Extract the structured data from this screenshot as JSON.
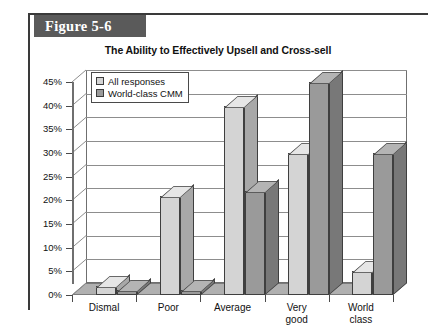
{
  "figure": {
    "tab_label": "Figure 5-6"
  },
  "chart_data": {
    "type": "bar",
    "title": "The Ability to Effectively Upsell and Cross-sell",
    "xlabel": "",
    "ylabel": "",
    "ylim": [
      0,
      45
    ],
    "ytick_labels": [
      "0%",
      "5%",
      "10%",
      "15%",
      "20%",
      "25%",
      "30%",
      "35%",
      "40%",
      "45%"
    ],
    "ytick_values": [
      0,
      5,
      10,
      15,
      20,
      25,
      30,
      35,
      40,
      45
    ],
    "grid": true,
    "legend_position": "top-left",
    "three_d": true,
    "categories": [
      "Dismal",
      "Poor",
      "Average",
      "Very good",
      "World class"
    ],
    "category_lines": [
      [
        "Dismal"
      ],
      [
        "Poor"
      ],
      [
        "Average"
      ],
      [
        "Very",
        "good"
      ],
      [
        "World",
        "class"
      ]
    ],
    "series": [
      {
        "name": "All responses",
        "color": "#d4d4d4",
        "values": [
          2,
          21,
          40,
          30,
          5
        ]
      },
      {
        "name": "World-class CMM",
        "color": "#9a9a9a",
        "values": [
          1,
          1,
          22,
          45,
          30
        ]
      }
    ]
  }
}
